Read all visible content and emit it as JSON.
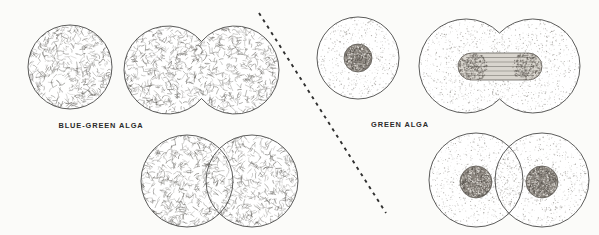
{
  "figure": {
    "background_color": "#fbfbf9",
    "ink_color": "#4a4a48",
    "nucleus_color": "#8a847d",
    "divider": {
      "name": "diagonal-dashed-divider",
      "style": "dashed",
      "x1": 259,
      "y1": 13,
      "x2": 386,
      "y2": 213,
      "color": "#2f2f2f"
    },
    "panels": [
      {
        "id": "blue-green",
        "label": "BLUE-GREEN ALGA",
        "label_x": 101,
        "label_y": 128,
        "organism_type": "prokaryote",
        "has_nucleus": false,
        "division_type": "binary fission",
        "texture": "squiggles",
        "stages": [
          {
            "name": "single-cell",
            "caption": "undivided cell",
            "cells": [
              {
                "cx": 70,
                "cy": 67,
                "r": 42
              }
            ]
          },
          {
            "name": "dividing-cell",
            "caption": "cell constricting into two",
            "cells": [
              {
                "cx": 168,
                "cy": 70,
                "r": 44
              },
              {
                "cx": 235,
                "cy": 70,
                "r": 44
              }
            ]
          },
          {
            "name": "two-daughter-cells",
            "caption": "two separate daughter cells",
            "cells": [
              {
                "cx": 187,
                "cy": 181,
                "r": 46
              },
              {
                "cx": 252,
                "cy": 181,
                "r": 46
              }
            ]
          }
        ]
      },
      {
        "id": "green",
        "label": "GREEN ALGA",
        "label_x": 400,
        "label_y": 127,
        "organism_type": "eukaryote",
        "has_nucleus": true,
        "division_type": "mitosis",
        "texture": "stipple",
        "stages": [
          {
            "name": "single-cell",
            "caption": "undivided cell with nucleus",
            "cells": [
              {
                "cx": 358,
                "cy": 58,
                "r": 41
              }
            ],
            "nuclei": [
              {
                "cx": 358,
                "cy": 58,
                "r": 14
              }
            ]
          },
          {
            "name": "dividing-cell",
            "caption": "mitotic spindle with chromosomes at poles",
            "cells": [
              {
                "cx": 466,
                "cy": 66,
                "r": 47
              },
              {
                "cx": 533,
                "cy": 66,
                "r": 47
              }
            ],
            "spindle": {
              "x": 458,
              "y": 53,
              "width": 84,
              "height": 27,
              "fiber_count": 5,
              "pole_color": "#6f6a64"
            }
          },
          {
            "name": "two-daughter-cells",
            "caption": "two separate daughter cells each with a nucleus",
            "cells": [
              {
                "cx": 476,
                "cy": 180,
                "r": 47
              },
              {
                "cx": 542,
                "cy": 180,
                "r": 47
              }
            ],
            "nuclei": [
              {
                "cx": 476,
                "cy": 182,
                "r": 16
              },
              {
                "cx": 542,
                "cy": 182,
                "r": 16
              }
            ]
          }
        ]
      }
    ]
  }
}
